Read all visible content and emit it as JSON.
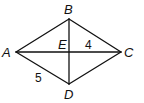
{
  "figure": {
    "type": "rhombus-with-diagonals",
    "vertices": {
      "A": {
        "label": "A",
        "x": 16,
        "y": 52
      },
      "B": {
        "label": "B",
        "x": 69,
        "y": 19
      },
      "C": {
        "label": "C",
        "x": 121,
        "y": 52
      },
      "D": {
        "label": "D",
        "x": 69,
        "y": 84
      },
      "E": {
        "label": "E",
        "x": 69,
        "y": 52
      }
    },
    "measurements": {
      "EC": "4",
      "AD": "5"
    }
  }
}
